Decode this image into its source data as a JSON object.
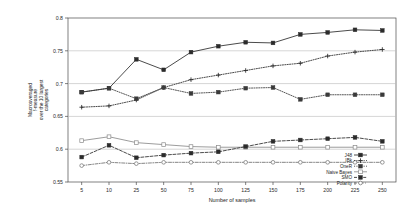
{
  "chart_data": {
    "type": "line",
    "title": "",
    "xlabel": "Number of samples",
    "ylabel": "Macroaveraged f-measure over the 10 largest categories",
    "ylabel_lines": [
      "Macroaveraged",
      "f-measure",
      "over the 10 largest",
      "categories"
    ],
    "categories": [
      5,
      10,
      25,
      50,
      75,
      100,
      125,
      150,
      175,
      200,
      225,
      250
    ],
    "xtick_labels": [
      "5",
      "10",
      "25",
      "50",
      "75",
      "100",
      "125",
      "150",
      "175",
      "200",
      "225",
      "250"
    ],
    "ytick_labels": [
      "0.8",
      "0.75",
      "0.7",
      "0.65",
      "0.6",
      "0.55"
    ],
    "yticks": [
      0.8,
      0.75,
      0.7,
      0.65,
      0.6,
      0.55
    ],
    "ylim": [
      0.55,
      0.8
    ],
    "grid": true,
    "grid_axis": "y",
    "legend_position": "bottom-right",
    "series": [
      {
        "name": "J48",
        "marker": "filled-square",
        "line": "solid",
        "color": "#2b2b2b",
        "values": [
          0.687,
          0.693,
          0.737,
          0.721,
          0.748,
          0.757,
          0.763,
          0.762,
          0.775,
          0.778,
          0.782,
          0.781
        ]
      },
      {
        "name": "IBk",
        "marker": "plus",
        "line": "dotted",
        "color": "#2b2b2b",
        "values": [
          0.664,
          0.666,
          0.675,
          0.694,
          0.706,
          0.713,
          0.72,
          0.727,
          0.731,
          0.742,
          0.748,
          0.752
        ]
      },
      {
        "name": "OneR",
        "marker": "filled-square",
        "line": "dotted",
        "color": "#3a3a3a",
        "values": [
          0.687,
          0.693,
          0.677,
          0.694,
          0.685,
          0.687,
          0.693,
          0.694,
          0.676,
          0.683,
          0.683,
          0.683
        ]
      },
      {
        "name": "Naive Bayes",
        "marker": "open-square",
        "line": "solid",
        "color": "#8a8a8a",
        "values": [
          0.613,
          0.619,
          0.61,
          0.607,
          0.604,
          0.603,
          0.603,
          0.603,
          0.603,
          0.603,
          0.603,
          0.603
        ]
      },
      {
        "name": "SMO",
        "marker": "filled-square",
        "line": "dashed",
        "color": "#2b2b2b",
        "values": [
          0.588,
          0.606,
          0.587,
          0.591,
          0.594,
          0.596,
          0.604,
          0.612,
          0.614,
          0.616,
          0.618,
          0.612
        ]
      },
      {
        "name": "Polarity",
        "marker": "open-circle",
        "line": "dash-dot",
        "color": "#6f6f6f",
        "values": [
          0.575,
          0.58,
          0.578,
          0.58,
          0.58,
          0.58,
          0.58,
          0.58,
          0.58,
          0.58,
          0.58,
          0.58
        ]
      }
    ]
  }
}
